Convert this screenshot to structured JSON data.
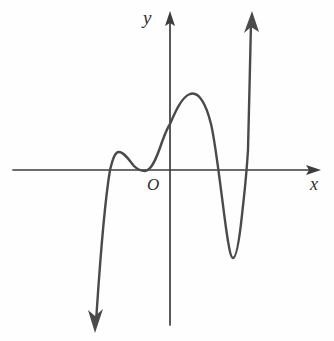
{
  "figure": {
    "kind": "coordinate-plane-curve-sketch",
    "background_color": "#fefefe",
    "axis_color": "#3c3c3c",
    "curve_color": "#4a4a4a"
  },
  "labels": {
    "y_axis": "y",
    "x_axis": "x",
    "origin": "O"
  },
  "chart_data": {
    "type": "line",
    "title": "",
    "subtitle": "",
    "xlabel": "x",
    "ylabel": "y",
    "origin_label": "O",
    "grid": false,
    "legend": null,
    "ticks": {
      "x": [],
      "y": []
    },
    "axes": {
      "origin_px": [
        170,
        170
      ],
      "x_axis_px": {
        "y": 170,
        "x_start": 13,
        "x_end": 320,
        "arrow": "right"
      },
      "y_axis_px": {
        "x": 170,
        "y_top": 12,
        "y_bottom": 325,
        "arrow": "up"
      },
      "xlim_px": [
        13,
        320
      ],
      "ylim_px": [
        12,
        325
      ]
    },
    "annotations": [
      {
        "name": "lower-left-arrow-tip",
        "x_px": 96,
        "y_px": 330
      },
      {
        "name": "x-intercept-left",
        "x_px": 110,
        "y_px": 170
      },
      {
        "name": "local-max-small",
        "x_px": 118,
        "y_px": 152
      },
      {
        "name": "local-min-touching-axis",
        "x_px": 145,
        "y_px": 171
      },
      {
        "name": "y-intercept",
        "x_px": 170,
        "y_px": 124
      },
      {
        "name": "local-max-tall",
        "x_px": 190,
        "y_px": 94
      },
      {
        "name": "x-intercept-middle",
        "x_px": 213,
        "y_px": 170
      },
      {
        "name": "local-min-deep",
        "x_px": 232,
        "y_px": 258
      },
      {
        "name": "x-intercept-right",
        "x_px": 246,
        "y_px": 170
      },
      {
        "name": "upper-right-arrow-tip",
        "x_px": 252,
        "y_px": 12
      }
    ],
    "curve_path": "M 96 322 C 99 278 103 212 110 170 C 113 158 115 152 119 152 C 124 152 129 160 134 166 C 138 170 141 171 145 171 C 151 171 156 160 162 142 C 166 131 168 127 170 124 C 176 110 182 97 190 94 C 199 91 206 104 211 124 C 216 145 221 192 226 228 C 229 249 231 258 233 258 C 236 258 239 243 242 215 C 244 196 246 182 248 150 C 249 121 250 60 251 22"
  }
}
